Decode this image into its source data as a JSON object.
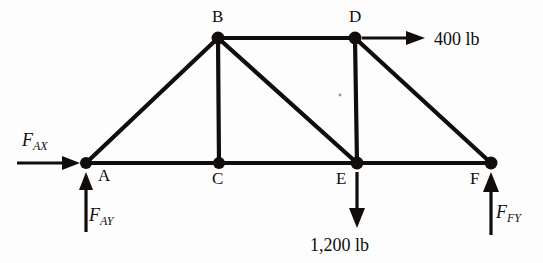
{
  "figure": {
    "type": "truss-free-body-diagram",
    "background_color": "#fdfdfd",
    "ink_color": "#100d0b"
  },
  "joints": [
    {
      "id": "A",
      "label": "A",
      "x": 86,
      "y": 163,
      "label_x": 98,
      "label_y": 181
    },
    {
      "id": "B",
      "label": "B",
      "x": 218,
      "y": 38,
      "label_x": 212,
      "label_y": 22
    },
    {
      "id": "C",
      "label": "C",
      "x": 219,
      "y": 163,
      "label_x": 212,
      "label_y": 184
    },
    {
      "id": "D",
      "label": "D",
      "x": 355,
      "y": 38,
      "label_x": 349,
      "label_y": 22
    },
    {
      "id": "E",
      "label": "E",
      "x": 357,
      "y": 163,
      "label_x": 336,
      "label_y": 184
    },
    {
      "id": "F",
      "label": "F",
      "x": 491,
      "y": 163,
      "label_x": 470,
      "label_y": 184
    }
  ],
  "members": [
    {
      "id": "AB",
      "from": "A",
      "to": "B"
    },
    {
      "id": "AC",
      "from": "A",
      "to": "C"
    },
    {
      "id": "BC",
      "from": "B",
      "to": "C"
    },
    {
      "id": "BD",
      "from": "B",
      "to": "D"
    },
    {
      "id": "BE",
      "from": "B",
      "to": "E"
    },
    {
      "id": "CE",
      "from": "C",
      "to": "E"
    },
    {
      "id": "DE",
      "from": "D",
      "to": "E"
    },
    {
      "id": "DF",
      "from": "D",
      "to": "F"
    },
    {
      "id": "EF",
      "from": "E",
      "to": "F"
    }
  ],
  "forces": [
    {
      "id": "FAX",
      "symbol": "F",
      "subscript": "AX",
      "kind": "reaction",
      "direction": "right",
      "applied_at": "A",
      "label_x": 22,
      "label_y": 146
    },
    {
      "id": "FAY",
      "symbol": "F",
      "subscript": "AY",
      "kind": "reaction",
      "direction": "up",
      "applied_at": "A",
      "label_x": 89,
      "label_y": 221
    },
    {
      "id": "FFY",
      "symbol": "F",
      "subscript": "FY",
      "kind": "reaction",
      "direction": "up",
      "applied_at": "F",
      "label_x": 496,
      "label_y": 218
    }
  ],
  "loads": [
    {
      "id": "load-400",
      "label": "400 lb",
      "magnitude": 400,
      "unit": "lb",
      "direction": "right",
      "applied_at": "D",
      "label_x": 434,
      "label_y": 45
    },
    {
      "id": "load-1200",
      "label": "1,200 lb",
      "magnitude": 1200,
      "unit": "lb",
      "direction": "down",
      "applied_at": "E",
      "label_x": 310,
      "label_y": 251
    }
  ]
}
